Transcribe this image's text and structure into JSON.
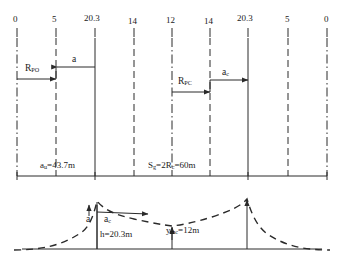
{
  "figure": {
    "type": "engineering-cross-section-diagram",
    "width": 344,
    "height": 264,
    "stroke_color": "#2a2a2a",
    "background": "#ffffff"
  },
  "top_scale": {
    "name": "station-ruler",
    "ticks": [
      {
        "label": "0",
        "x": 17,
        "line_style": "dashdot"
      },
      {
        "label": "5",
        "x": 56,
        "line_style": "dashed"
      },
      {
        "label": "20.3",
        "x": 95,
        "line_style": "solid"
      },
      {
        "label": "14",
        "x": 134,
        "line_style": "dashed"
      },
      {
        "label": "12",
        "x": 172,
        "line_style": "dashdot"
      },
      {
        "label": "14",
        "x": 210,
        "line_style": "dashed"
      },
      {
        "label": "20.3",
        "x": 248,
        "line_style": "solid"
      },
      {
        "label": "5",
        "x": 288,
        "line_style": "dashed"
      },
      {
        "label": "0",
        "x": 327,
        "line_style": "dashdot"
      }
    ]
  },
  "annotations": {
    "r_po": {
      "base": "R",
      "sub": "PO"
    },
    "r_pc": {
      "base": "R",
      "sub": "PC"
    },
    "a_left": {
      "base": "a",
      "sub": ""
    },
    "a_c_right": {
      "base": "a",
      "sub": "c"
    },
    "a_bottom": {
      "base": "a",
      "sub": ""
    },
    "a_c_bottom": {
      "base": "a",
      "sub": "c"
    }
  },
  "dimensions": {
    "left_span": {
      "base": "a",
      "sub": "u",
      "equals": "=43.7m",
      "full": "a_u=43.7m"
    },
    "center_span": {
      "base": "S",
      "sub": "g",
      "mid": "=2R",
      "sub2": "c",
      "equals": "=60m",
      "full": "S_g=2R_c=60m"
    }
  },
  "profile": {
    "height_label": {
      "text": "h=20.3m"
    },
    "ymax_label": {
      "base": "y",
      "sub": "mc",
      "equals": "=12m",
      "full": "y_mc=12m"
    },
    "curve_style": "dashed",
    "ground_line": "solid"
  }
}
